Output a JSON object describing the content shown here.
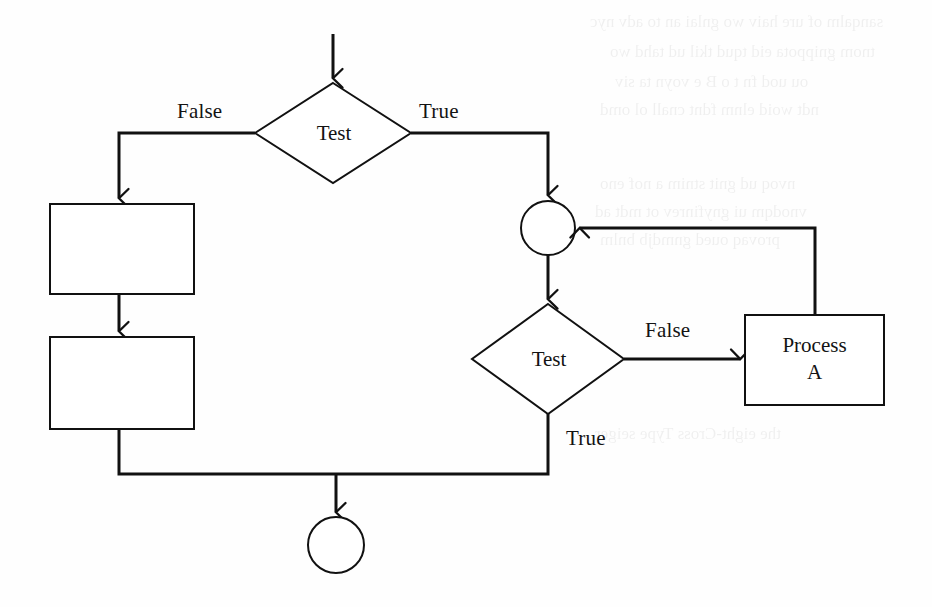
{
  "diagram": {
    "type": "flowchart",
    "stroke_color": "#111111",
    "background_color": "#fefefe",
    "canvas": {
      "width": 932,
      "height": 607
    },
    "nodes": [
      {
        "id": "start-arrow",
        "name": "entry-arrow",
        "shape": "arrow",
        "label": "",
        "x1": 333,
        "y1": 34,
        "x2": 333,
        "y2": 83
      },
      {
        "id": "decision-top",
        "name": "decision-test-top",
        "shape": "diamond",
        "label": "Test",
        "cx": 333,
        "cy": 133,
        "half_width": 78,
        "half_height": 50
      },
      {
        "id": "process-box-1",
        "name": "process-box-1",
        "shape": "rectangle",
        "label": "",
        "x": 50,
        "y": 204,
        "width": 144,
        "height": 90
      },
      {
        "id": "process-box-2",
        "name": "process-box-2",
        "shape": "rectangle",
        "label": "",
        "x": 50,
        "y": 337,
        "width": 144,
        "height": 92
      },
      {
        "id": "merge-node",
        "name": "merge-circle",
        "shape": "circle",
        "label": "",
        "cx": 548,
        "cy": 228,
        "r": 27
      },
      {
        "id": "decision-bottom",
        "name": "decision-test-bottom",
        "shape": "diamond",
        "label": "Test",
        "cx": 548,
        "cy": 359,
        "half_width": 76,
        "half_height": 55
      },
      {
        "id": "process-a",
        "name": "process-a-box",
        "shape": "rectangle",
        "label": "Process\nA",
        "label_line1": "Process",
        "label_line2": "A",
        "x": 745,
        "y": 315,
        "width": 139,
        "height": 90
      },
      {
        "id": "end-node",
        "name": "end-circle",
        "shape": "circle",
        "label": "",
        "cx": 336,
        "cy": 545,
        "r": 28
      }
    ],
    "edge_labels": [
      {
        "id": "label-false-top",
        "name": "edge-label-false-top",
        "text": "False",
        "x": 177,
        "y": 99
      },
      {
        "id": "label-true-top",
        "name": "edge-label-true-top",
        "text": "True",
        "x": 419,
        "y": 99
      },
      {
        "id": "label-false-bottom",
        "name": "edge-label-false-bottom",
        "text": "False",
        "x": 645,
        "y": 318
      },
      {
        "id": "label-true-bottom",
        "name": "edge-label-true-bottom",
        "text": "True",
        "x": 566,
        "y": 426
      }
    ],
    "edges": [
      {
        "id": "e-start",
        "name": "edge-entry-to-decision-top",
        "from": "start",
        "to": "decision-top",
        "label": ""
      },
      {
        "id": "e-top-false",
        "name": "edge-decision-top-false",
        "from": "decision-top",
        "to": "process-box-1",
        "label": "False"
      },
      {
        "id": "e-top-true",
        "name": "edge-decision-top-true",
        "from": "decision-top",
        "to": "merge-node",
        "label": "True"
      },
      {
        "id": "e-box1-box2",
        "name": "edge-box1-to-box2",
        "from": "process-box-1",
        "to": "process-box-2",
        "label": ""
      },
      {
        "id": "e-box2-end",
        "name": "edge-box2-to-end",
        "from": "process-box-2",
        "to": "end-node",
        "label": ""
      },
      {
        "id": "e-merge-dec",
        "name": "edge-merge-to-decision-bottom",
        "from": "merge-node",
        "to": "decision-bottom",
        "label": ""
      },
      {
        "id": "e-bot-false",
        "name": "edge-decision-bottom-false",
        "from": "decision-bottom",
        "to": "process-a",
        "label": "False"
      },
      {
        "id": "e-bot-true",
        "name": "edge-decision-bottom-true",
        "from": "decision-bottom",
        "to": "end-node",
        "label": "True"
      },
      {
        "id": "e-feedback",
        "name": "edge-process-a-feedback-to-merge",
        "from": "process-a",
        "to": "merge-node",
        "label": ""
      }
    ]
  },
  "background_bleed": {
    "visible": true,
    "description": "faint mirrored show-through text from the reverse side of the scanned page",
    "lines": [
      {
        "text": "sanqalm of ure haiv wo gnlai an to adv nyc",
        "x": 590,
        "y": 6
      },
      {
        "text": "tnom gnippota eid tqud tkil ud tahd wo",
        "x": 610,
        "y": 36
      },
      {
        "text": "ou uod fn t o B e voyn ta siv",
        "x": 615,
        "y": 66
      },
      {
        "text": "ndt woid elnm fdnt cnall ol omd",
        "x": 600,
        "y": 94
      },
      {
        "text": "nvoq ud gnit stnim a nof eno",
        "x": 600,
        "y": 168
      },
      {
        "text": "vnodqm ui gnyfinrev ot mdt ad",
        "x": 595,
        "y": 196
      },
      {
        "text": "provaq oued gnmdjb bnlm",
        "x": 600,
        "y": 224
      },
      {
        "text": "the eight-Cross Type seiger",
        "x": 595,
        "y": 418
      }
    ]
  }
}
